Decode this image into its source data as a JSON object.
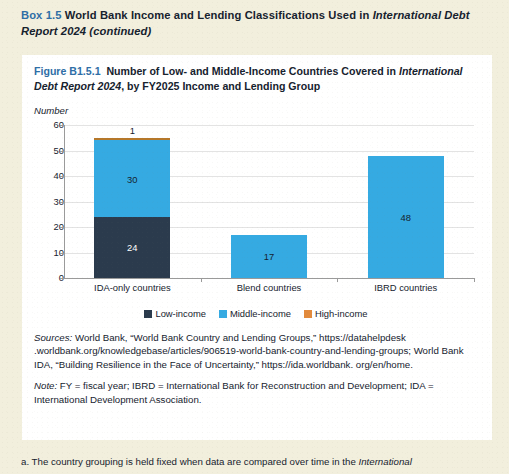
{
  "box": {
    "label": "Box 1.5",
    "title_part1": "World Bank Income and Lending Classifications Used in ",
    "title_italic": "International Debt Report 2024",
    "title_part2": " (continued)"
  },
  "figure": {
    "number": "Figure B1.5.1",
    "title_part1": "Number of Low- and Middle-Income Countries Covered in ",
    "title_italic": "International Debt Report 2024",
    "title_part2": ", by FY2025 Income and Lending Group",
    "axis_title": "Number"
  },
  "chart_data": {
    "type": "bar",
    "subtype": "stacked-bar",
    "title": "Number of Low- and Middle-Income Countries Covered in International Debt Report 2024, by FY2025 Income and Lending Group",
    "xlabel": "",
    "ylabel": "Number",
    "ylim": [
      0,
      60
    ],
    "yticks": [
      0,
      10,
      20,
      30,
      40,
      50,
      60
    ],
    "ytick_labels": [
      "0",
      "10",
      "20",
      "30",
      "40",
      "50",
      "60"
    ],
    "grid": true,
    "legend_position": "bottom",
    "categories": [
      "IDA-only countries",
      "Blend countries",
      "IBRD countries"
    ],
    "series": [
      {
        "name": "Low-income",
        "color": "#2b3b4d",
        "values": [
          24,
          0,
          0
        ]
      },
      {
        "name": "Middle-income",
        "color": "#35aae2",
        "values": [
          30,
          17,
          48
        ]
      },
      {
        "name": "High-income",
        "color": "#b5772a",
        "values": [
          1,
          0,
          0
        ]
      }
    ],
    "totals": [
      55,
      17,
      48
    ],
    "data_labels": {
      "IDA-only countries": {
        "Low-income": "24",
        "Middle-income": "30",
        "High-income": "1"
      },
      "Blend countries": {
        "Middle-income": "17"
      },
      "IBRD countries": {
        "Middle-income": "48"
      }
    }
  },
  "legend": [
    {
      "label": "Low-income",
      "color": "#2b3b4d"
    },
    {
      "label": "Middle-income",
      "color": "#35aae2"
    },
    {
      "label": "High-income",
      "color": "#e28a3c"
    }
  ],
  "notes": {
    "sources_label": "Sources:",
    "sources_text": " World Bank, “World Bank Country and Lending Groups,” https://datahelpdesk .worldbank.org/knowledgebase/articles/906519-world-bank-country-and-lending-groups; World Bank IDA, “Building Resilience in the Face of Uncertainty,” https://ida.worldbank. org/en/home.",
    "note_label": "Note:",
    "note_text": " FY = fiscal year; IBRD = International Bank for Reconstruction and Development; IDA = International Development Association."
  },
  "footnote": {
    "marker": "a.",
    "text_part1": " The country grouping is held fixed when data are compared over time in the ",
    "text_italic": "International"
  }
}
